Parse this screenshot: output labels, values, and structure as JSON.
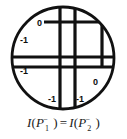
{
  "figure": {
    "type": "diagram",
    "colors": {
      "stroke": "#111111",
      "background": "#ffffff",
      "label_text": "#0d0d0d",
      "caption_text": "#1a1a1a"
    },
    "circle": {
      "cx": 63,
      "cy": 58,
      "r": 52,
      "stroke_width": 2.6
    },
    "grid_lines": [
      {
        "id": "v1",
        "orientation": "vertical",
        "x": 60.0,
        "thickness": 3.0,
        "y_from": 8,
        "y_to": 112
      },
      {
        "id": "v2",
        "orientation": "vertical",
        "x": 75.0,
        "thickness": 3.0,
        "y_from": 8,
        "y_to": 112
      },
      {
        "id": "v3",
        "orientation": "vertical",
        "x": 102.0,
        "thickness": 3.0,
        "y_from": 10,
        "y_to": 70
      },
      {
        "id": "h1",
        "orientation": "horizontal",
        "y": 57.0,
        "thickness": 3.0,
        "x_from": 11,
        "x_to": 115
      },
      {
        "id": "h2",
        "orientation": "horizontal",
        "y": 67.0,
        "thickness": 3.0,
        "x_from": 11,
        "x_to": 115
      },
      {
        "id": "h3",
        "orientation": "horizontal",
        "y": 22.0,
        "thickness": 3.0,
        "x_from": 44,
        "x_to": 112
      }
    ],
    "region_labels": [
      {
        "name": "label-top-left-zero",
        "text": "0",
        "x": 39,
        "y": 24
      },
      {
        "name": "label-upper-left-minus-one",
        "text": "-1",
        "x": 23,
        "y": 41
      },
      {
        "name": "label-lower-left-minus-one",
        "text": "-1",
        "x": 23,
        "y": 72
      },
      {
        "name": "label-right-zero",
        "text": "0",
        "x": 95,
        "y": 83
      },
      {
        "name": "label-bottom-left-minus-one",
        "text": "-1",
        "x": 51,
        "y": 100
      },
      {
        "name": "label-bottom-right-minus-one",
        "text": "-1",
        "x": 78,
        "y": 100
      }
    ]
  },
  "caption": {
    "full_text": "I(P1-) = I(P2-)",
    "left_function": "I",
    "left_open": "(",
    "left_point": "P",
    "left_subscript": "1",
    "left_superscript": "−",
    "left_close": ")",
    "equals": "=",
    "right_function": "I",
    "right_open": "(",
    "right_point": "P",
    "right_subscript": "2",
    "right_superscript": "−",
    "right_close": ")"
  }
}
